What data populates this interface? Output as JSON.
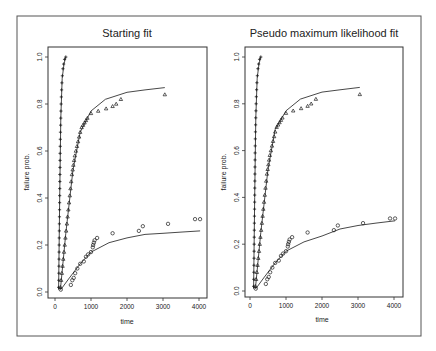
{
  "figure": {
    "frame_color": "#555555",
    "ink_color": "#1a1a1a",
    "line_color": "#333333"
  },
  "chart_data": [
    {
      "type": "scatter",
      "title": "Starting fit",
      "xlabel": "time",
      "ylabel": "failure prob.",
      "xlim": [
        0,
        4100
      ],
      "ylim": [
        0,
        1
      ],
      "xticks": [
        0,
        1000,
        2000,
        3000,
        4000
      ],
      "xtick_labels": [
        "0",
        "1000",
        "2000",
        "3000",
        "4000"
      ],
      "yticks": [
        0,
        0.2,
        0.4,
        0.6,
        0.8,
        1.0
      ],
      "ytick_labels": [
        "0.0",
        "0.2",
        "0.4",
        "0.6",
        "0.8",
        "1.0"
      ],
      "grid": false,
      "series": [
        {
          "name": "group 1 (plus)",
          "marker": "+",
          "points": [
            [
              100,
              0.02
            ],
            [
              105,
              0.05
            ],
            [
              108,
              0.08
            ],
            [
              110,
              0.11
            ],
            [
              112,
              0.14
            ],
            [
              114,
              0.17
            ],
            [
              116,
              0.2
            ],
            [
              118,
              0.23
            ],
            [
              120,
              0.26
            ],
            [
              122,
              0.29
            ],
            [
              124,
              0.32
            ],
            [
              126,
              0.35
            ],
            [
              128,
              0.38
            ],
            [
              130,
              0.41
            ],
            [
              132,
              0.44
            ],
            [
              134,
              0.47
            ],
            [
              136,
              0.5
            ],
            [
              138,
              0.53
            ],
            [
              140,
              0.56
            ],
            [
              142,
              0.59
            ],
            [
              145,
              0.62
            ],
            [
              148,
              0.65
            ],
            [
              152,
              0.68
            ],
            [
              156,
              0.71
            ],
            [
              160,
              0.74
            ],
            [
              165,
              0.77
            ],
            [
              170,
              0.8
            ],
            [
              176,
              0.83
            ],
            [
              183,
              0.86
            ],
            [
              192,
              0.89
            ],
            [
              205,
              0.92
            ],
            [
              220,
              0.95
            ],
            [
              240,
              0.97
            ],
            [
              265,
              0.99
            ],
            [
              300,
              1.0
            ]
          ],
          "fit_line": [
            [
              100,
              0.01
            ],
            [
              130,
              0.4
            ],
            [
              160,
              0.74
            ],
            [
              200,
              0.91
            ],
            [
              250,
              0.97
            ],
            [
              300,
              1.0
            ]
          ]
        },
        {
          "name": "group 2 (triangle)",
          "marker": "triangle",
          "points": [
            [
              150,
              0.02
            ],
            [
              170,
              0.05
            ],
            [
              190,
              0.08
            ],
            [
              210,
              0.11
            ],
            [
              230,
              0.14
            ],
            [
              250,
              0.17
            ],
            [
              270,
              0.2
            ],
            [
              290,
              0.23
            ],
            [
              310,
              0.26
            ],
            [
              330,
              0.29
            ],
            [
              350,
              0.32
            ],
            [
              370,
              0.35
            ],
            [
              390,
              0.38
            ],
            [
              410,
              0.41
            ],
            [
              430,
              0.44
            ],
            [
              450,
              0.47
            ],
            [
              470,
              0.5
            ],
            [
              490,
              0.52
            ],
            [
              510,
              0.54
            ],
            [
              530,
              0.56
            ],
            [
              550,
              0.58
            ],
            [
              580,
              0.6
            ],
            [
              610,
              0.62
            ],
            [
              640,
              0.64
            ],
            [
              670,
              0.66
            ],
            [
              700,
              0.68
            ],
            [
              740,
              0.7
            ],
            [
              780,
              0.71
            ],
            [
              820,
              0.72
            ],
            [
              860,
              0.73
            ],
            [
              900,
              0.74
            ],
            [
              1000,
              0.76
            ],
            [
              1200,
              0.77
            ],
            [
              1420,
              0.78
            ],
            [
              1600,
              0.79
            ],
            [
              1700,
              0.8
            ],
            [
              1830,
              0.82
            ],
            [
              3050,
              0.84
            ]
          ],
          "fit_line": [
            [
              150,
              0.01
            ],
            [
              300,
              0.25
            ],
            [
              500,
              0.52
            ],
            [
              700,
              0.68
            ],
            [
              1000,
              0.77
            ],
            [
              1400,
              0.82
            ],
            [
              2000,
              0.85
            ],
            [
              2500,
              0.86
            ],
            [
              3050,
              0.87
            ]
          ]
        },
        {
          "name": "group 3 (circle)",
          "marker": "circle",
          "points": [
            [
              160,
              0.01
            ],
            [
              440,
              0.03
            ],
            [
              480,
              0.05
            ],
            [
              520,
              0.06
            ],
            [
              560,
              0.08
            ],
            [
              620,
              0.1
            ],
            [
              700,
              0.12
            ],
            [
              800,
              0.13
            ],
            [
              860,
              0.15
            ],
            [
              920,
              0.16
            ],
            [
              1000,
              0.17
            ],
            [
              1050,
              0.19
            ],
            [
              1060,
              0.2
            ],
            [
              1080,
              0.21
            ],
            [
              1100,
              0.22
            ],
            [
              1170,
              0.23
            ],
            [
              1600,
              0.25
            ],
            [
              2330,
              0.26
            ],
            [
              2440,
              0.28
            ],
            [
              3140,
              0.29
            ],
            [
              3890,
              0.31
            ],
            [
              4030,
              0.31
            ]
          ],
          "fit_line": [
            [
              160,
              0.01
            ],
            [
              400,
              0.06
            ],
            [
              700,
              0.12
            ],
            [
              1000,
              0.17
            ],
            [
              1500,
              0.21
            ],
            [
              2000,
              0.23
            ],
            [
              2500,
              0.245
            ],
            [
              3000,
              0.25
            ],
            [
              3500,
              0.255
            ],
            [
              4030,
              0.26
            ]
          ]
        }
      ]
    },
    {
      "type": "scatter",
      "title": "Pseudo maximum likelihood fit",
      "xlabel": "time",
      "ylabel": "failure prob.",
      "xlim": [
        0,
        4100
      ],
      "ylim": [
        0,
        1
      ],
      "xticks": [
        0,
        1000,
        2000,
        3000,
        4000
      ],
      "xtick_labels": [
        "0",
        "1000",
        "2000",
        "3000",
        "4000"
      ],
      "yticks": [
        0,
        0.2,
        0.4,
        0.6,
        0.8,
        1.0
      ],
      "ytick_labels": [
        "0.0",
        "0.2",
        "0.4",
        "0.6",
        "0.8",
        "1.0"
      ],
      "grid": false,
      "series": [
        {
          "name": "group 1 (plus)",
          "marker": "+",
          "points": [
            [
              100,
              0.02
            ],
            [
              105,
              0.05
            ],
            [
              108,
              0.08
            ],
            [
              110,
              0.11
            ],
            [
              112,
              0.14
            ],
            [
              114,
              0.17
            ],
            [
              116,
              0.2
            ],
            [
              118,
              0.23
            ],
            [
              120,
              0.26
            ],
            [
              122,
              0.29
            ],
            [
              124,
              0.32
            ],
            [
              126,
              0.35
            ],
            [
              128,
              0.38
            ],
            [
              130,
              0.41
            ],
            [
              132,
              0.44
            ],
            [
              134,
              0.47
            ],
            [
              136,
              0.5
            ],
            [
              138,
              0.53
            ],
            [
              140,
              0.56
            ],
            [
              142,
              0.59
            ],
            [
              145,
              0.62
            ],
            [
              148,
              0.65
            ],
            [
              152,
              0.68
            ],
            [
              156,
              0.71
            ],
            [
              160,
              0.74
            ],
            [
              165,
              0.77
            ],
            [
              170,
              0.8
            ],
            [
              176,
              0.83
            ],
            [
              183,
              0.86
            ],
            [
              192,
              0.89
            ],
            [
              205,
              0.92
            ],
            [
              220,
              0.95
            ],
            [
              240,
              0.97
            ],
            [
              265,
              0.99
            ],
            [
              300,
              1.0
            ]
          ],
          "fit_line": [
            [
              100,
              0.01
            ],
            [
              130,
              0.4
            ],
            [
              160,
              0.74
            ],
            [
              200,
              0.91
            ],
            [
              250,
              0.97
            ],
            [
              300,
              1.0
            ]
          ]
        },
        {
          "name": "group 2 (triangle)",
          "marker": "triangle",
          "points": [
            [
              150,
              0.02
            ],
            [
              170,
              0.05
            ],
            [
              190,
              0.08
            ],
            [
              210,
              0.11
            ],
            [
              230,
              0.14
            ],
            [
              250,
              0.17
            ],
            [
              270,
              0.2
            ],
            [
              290,
              0.23
            ],
            [
              310,
              0.26
            ],
            [
              330,
              0.29
            ],
            [
              350,
              0.32
            ],
            [
              370,
              0.35
            ],
            [
              390,
              0.38
            ],
            [
              410,
              0.41
            ],
            [
              430,
              0.44
            ],
            [
              450,
              0.47
            ],
            [
              470,
              0.5
            ],
            [
              490,
              0.52
            ],
            [
              510,
              0.54
            ],
            [
              530,
              0.56
            ],
            [
              550,
              0.58
            ],
            [
              580,
              0.6
            ],
            [
              610,
              0.62
            ],
            [
              640,
              0.64
            ],
            [
              670,
              0.66
            ],
            [
              700,
              0.68
            ],
            [
              740,
              0.7
            ],
            [
              780,
              0.71
            ],
            [
              820,
              0.72
            ],
            [
              860,
              0.73
            ],
            [
              900,
              0.74
            ],
            [
              1000,
              0.76
            ],
            [
              1200,
              0.77
            ],
            [
              1420,
              0.78
            ],
            [
              1600,
              0.79
            ],
            [
              1700,
              0.8
            ],
            [
              1830,
              0.82
            ],
            [
              3050,
              0.84
            ]
          ],
          "fit_line": [
            [
              150,
              0.01
            ],
            [
              300,
              0.25
            ],
            [
              500,
              0.52
            ],
            [
              700,
              0.69
            ],
            [
              1000,
              0.77
            ],
            [
              1400,
              0.82
            ],
            [
              2000,
              0.85
            ],
            [
              2500,
              0.86
            ],
            [
              3050,
              0.87
            ]
          ]
        },
        {
          "name": "group 3 (circle)",
          "marker": "circle",
          "points": [
            [
              160,
              0.01
            ],
            [
              440,
              0.03
            ],
            [
              480,
              0.05
            ],
            [
              520,
              0.06
            ],
            [
              560,
              0.08
            ],
            [
              620,
              0.1
            ],
            [
              700,
              0.12
            ],
            [
              800,
              0.13
            ],
            [
              860,
              0.15
            ],
            [
              920,
              0.16
            ],
            [
              1000,
              0.17
            ],
            [
              1050,
              0.19
            ],
            [
              1060,
              0.2
            ],
            [
              1080,
              0.21
            ],
            [
              1100,
              0.22
            ],
            [
              1170,
              0.23
            ],
            [
              1600,
              0.25
            ],
            [
              2330,
              0.26
            ],
            [
              2440,
              0.28
            ],
            [
              3140,
              0.29
            ],
            [
              3890,
              0.31
            ],
            [
              4030,
              0.31
            ]
          ],
          "fit_line": [
            [
              160,
              0.01
            ],
            [
              400,
              0.06
            ],
            [
              700,
              0.12
            ],
            [
              1000,
              0.17
            ],
            [
              1500,
              0.21
            ],
            [
              2000,
              0.235
            ],
            [
              2500,
              0.265
            ],
            [
              3000,
              0.28
            ],
            [
              3500,
              0.29
            ],
            [
              4030,
              0.3
            ]
          ]
        }
      ]
    }
  ]
}
